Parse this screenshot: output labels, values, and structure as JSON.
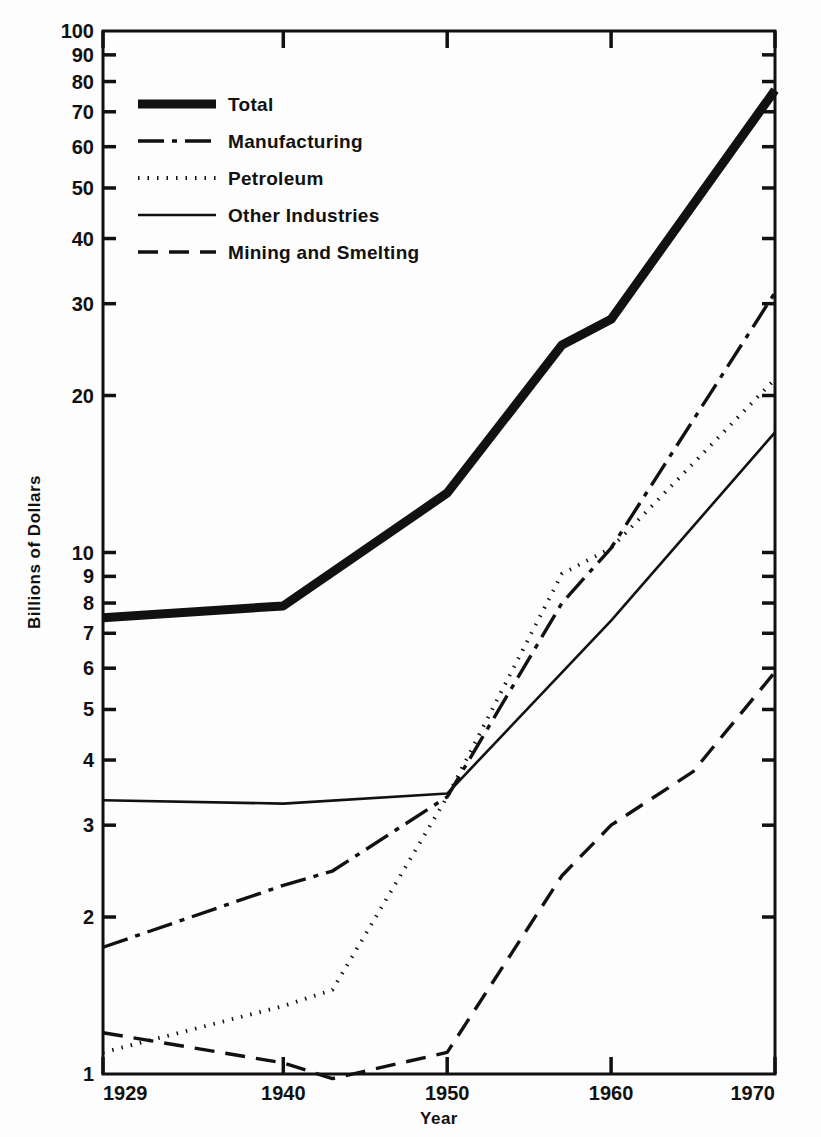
{
  "chart_data": {
    "type": "line",
    "title": "",
    "xlabel": "Year",
    "ylabel": "Billions of Dollars",
    "yscale": "log",
    "ylim": [
      1,
      100
    ],
    "xlim": [
      1929,
      1970
    ],
    "grid": false,
    "legend_position": "top-left",
    "y_ticks": [
      1,
      2,
      3,
      4,
      5,
      6,
      7,
      8,
      9,
      10,
      20,
      30,
      40,
      50,
      60,
      70,
      80,
      90,
      100
    ],
    "y_tick_labels": [
      "1",
      "2",
      "3",
      "4",
      "5",
      "6",
      "7",
      "8",
      "9",
      "10",
      "20",
      "30",
      "40",
      "50",
      "60",
      "70",
      "80",
      "90",
      "100"
    ],
    "x_ticks": [
      1929,
      1940,
      1950,
      1960,
      1970
    ],
    "x_tick_labels": [
      "1929",
      "1940",
      "1950",
      "1960",
      "1970"
    ],
    "series": [
      {
        "name": "Total",
        "style": "solid-thick",
        "x": [
          1929,
          1940,
          1950,
          1957,
          1960,
          1970
        ],
        "values": [
          7.5,
          7.9,
          13.0,
          25.0,
          28.0,
          77.0
        ]
      },
      {
        "name": "Manufacturing",
        "style": "dash-dot",
        "x": [
          1929,
          1940,
          1943,
          1950,
          1957,
          1960,
          1970
        ],
        "values": [
          1.75,
          2.3,
          2.45,
          3.4,
          8.0,
          10.2,
          31.5
        ]
      },
      {
        "name": "Petroleum",
        "style": "dotted",
        "x": [
          1929,
          1940,
          1943,
          1950,
          1957,
          1960,
          1970
        ],
        "values": [
          1.1,
          1.35,
          1.45,
          3.4,
          9.1,
          10.2,
          21.5
        ]
      },
      {
        "name": "Other Industries",
        "style": "solid-thin",
        "x": [
          1929,
          1940,
          1950,
          1960,
          1970
        ],
        "values": [
          3.35,
          3.3,
          3.45,
          7.4,
          17.0
        ]
      },
      {
        "name": "Mining and Smelting",
        "style": "dashed",
        "x": [
          1929,
          1940,
          1943,
          1950,
          1957,
          1960,
          1965,
          1970
        ],
        "values": [
          1.2,
          1.05,
          0.98,
          1.1,
          2.4,
          3.0,
          3.8,
          5.9
        ]
      }
    ]
  },
  "legend": {
    "items": [
      {
        "label": "Total",
        "style": "solid-thick"
      },
      {
        "label": "Manufacturing",
        "style": "dash-dot"
      },
      {
        "label": "Petroleum",
        "style": "dotted"
      },
      {
        "label": "Other Industries",
        "style": "solid-thin"
      },
      {
        "label": "Mining and Smelting",
        "style": "dashed"
      }
    ]
  },
  "axes": {
    "x_title": "Year",
    "y_title": "Billions of Dollars"
  },
  "colors": {
    "ink": "#111111",
    "background": "#fdfdfd"
  }
}
